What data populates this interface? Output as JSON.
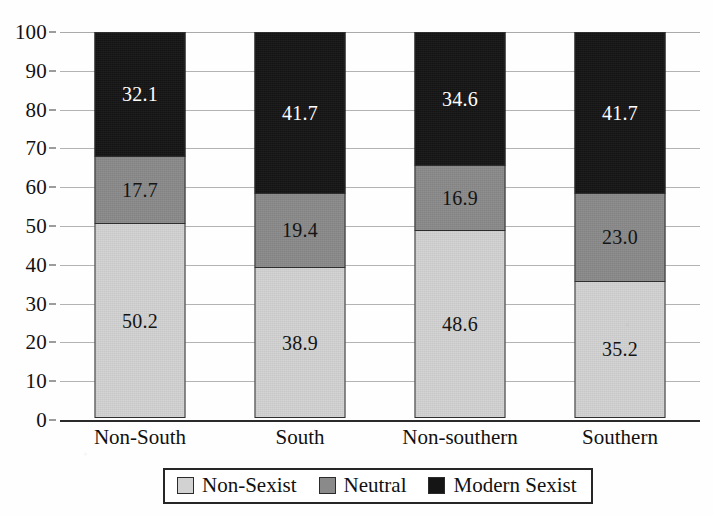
{
  "chart_data": {
    "type": "bar",
    "subtype": "stacked-bar-100",
    "title": "",
    "subtitle": "",
    "xlabel": "",
    "ylabel": "",
    "ylim": [
      0,
      100
    ],
    "yticks": [
      0,
      10,
      20,
      30,
      40,
      50,
      60,
      70,
      80,
      90,
      100
    ],
    "ytick_labels": [
      "0",
      "10",
      "20",
      "30",
      "40",
      "50",
      "60",
      "70",
      "80",
      "90",
      "100"
    ],
    "grid": true,
    "grid_axis": "y",
    "legend_position": "bottom",
    "categories": [
      "Non-South",
      "South",
      "Non-southern",
      "Southern"
    ],
    "series": [
      {
        "name": "Non-Sexist",
        "color": "#d2d2d2",
        "values": [
          50.2,
          38.9,
          48.6,
          35.2
        ],
        "labels": [
          "50.2",
          "38.9",
          "48.6",
          "35.2"
        ]
      },
      {
        "name": "Neutral",
        "color": "#8a8a8a",
        "values": [
          17.7,
          19.4,
          16.9,
          23.0
        ],
        "labels": [
          "17.7",
          "19.4",
          "16.9",
          "23.0"
        ]
      },
      {
        "name": "Modern Sexist",
        "color": "#151515",
        "values": [
          32.1,
          41.7,
          34.6,
          41.7
        ],
        "labels": [
          "32.1",
          "41.7",
          "34.6",
          "41.7"
        ]
      }
    ],
    "stack_order_bottom_to_top": [
      "Non-Sexist",
      "Neutral",
      "Modern Sexist"
    ]
  },
  "axes": {
    "y_ticks": [
      {
        "value": 100,
        "label": "100"
      },
      {
        "value": 90,
        "label": "90"
      },
      {
        "value": 80,
        "label": "80"
      },
      {
        "value": 70,
        "label": "70"
      },
      {
        "value": 60,
        "label": "60"
      },
      {
        "value": 50,
        "label": "50"
      },
      {
        "value": 40,
        "label": "40"
      },
      {
        "value": 30,
        "label": "30"
      },
      {
        "value": 20,
        "label": "20"
      },
      {
        "value": 10,
        "label": "10"
      },
      {
        "value": 0,
        "label": "0"
      }
    ],
    "x_categories": [
      {
        "label": "Non-South"
      },
      {
        "label": "South"
      },
      {
        "label": "Non-southern"
      },
      {
        "label": "Southern"
      }
    ]
  },
  "bars": [
    {
      "category": "Non-South",
      "segments": [
        {
          "series": "Modern Sexist",
          "value": 32.1,
          "label": "32.1",
          "class": "modern"
        },
        {
          "series": "Neutral",
          "value": 17.7,
          "label": "17.7",
          "class": "neutral"
        },
        {
          "series": "Non-Sexist",
          "value": 50.2,
          "label": "50.2",
          "class": "nonsex"
        }
      ]
    },
    {
      "category": "South",
      "segments": [
        {
          "series": "Modern Sexist",
          "value": 41.7,
          "label": "41.7",
          "class": "modern"
        },
        {
          "series": "Neutral",
          "value": 19.4,
          "label": "19.4",
          "class": "neutral"
        },
        {
          "series": "Non-Sexist",
          "value": 38.9,
          "label": "38.9",
          "class": "nonsex"
        }
      ]
    },
    {
      "category": "Non-southern",
      "segments": [
        {
          "series": "Modern Sexist",
          "value": 34.6,
          "label": "34.6",
          "class": "modern"
        },
        {
          "series": "Neutral",
          "value": 16.9,
          "label": "16.9",
          "class": "neutral"
        },
        {
          "series": "Non-Sexist",
          "value": 48.6,
          "label": "48.6",
          "class": "nonsex"
        }
      ]
    },
    {
      "category": "Southern",
      "segments": [
        {
          "series": "Modern Sexist",
          "value": 41.7,
          "label": "41.7",
          "class": "modern"
        },
        {
          "series": "Neutral",
          "value": 23.0,
          "label": "23.0",
          "class": "neutral"
        },
        {
          "series": "Non-Sexist",
          "value": 35.2,
          "label": "35.2",
          "class": "nonsex"
        }
      ]
    }
  ],
  "legend": {
    "items": [
      {
        "label": "Non-Sexist",
        "class": "nonsex",
        "color": "#d2d2d2"
      },
      {
        "label": "Neutral",
        "class": "neutral",
        "color": "#8a8a8a"
      },
      {
        "label": "Modern Sexist",
        "class": "modern",
        "color": "#151515"
      }
    ]
  }
}
